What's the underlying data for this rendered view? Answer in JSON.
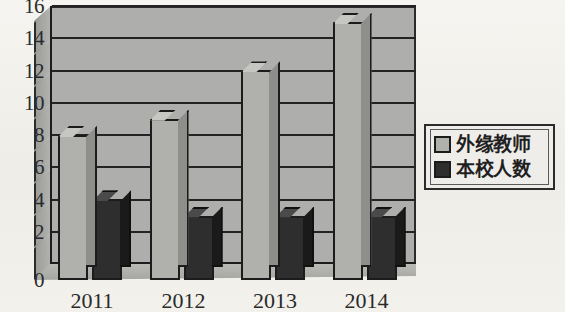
{
  "chart_data": {
    "type": "bar",
    "title": "",
    "subtitle": "",
    "xlabel": "",
    "ylabel": "",
    "categories": [
      "2011",
      "2012",
      "2013",
      "2014"
    ],
    "series": [
      {
        "name": "外缘教师",
        "values": [
          9,
          10,
          13,
          16
        ],
        "color": "#b0b0ad"
      },
      {
        "name": "本校人数",
        "values": [
          5,
          4,
          4,
          4
        ],
        "color": "#2e2e2e"
      }
    ],
    "ylim": [
      0,
      16
    ],
    "ytick_step": 2,
    "yticks": [
      "0",
      "2",
      "4",
      "6",
      "8",
      "10",
      "12",
      "14",
      "16"
    ],
    "grid": true,
    "legend_position": "right",
    "style": "3d-bar",
    "annotations": []
  },
  "legend": {
    "items": [
      {
        "label": "外缘教师",
        "swatch": "light-gray-swatch"
      },
      {
        "label": "本校人数",
        "swatch": "dark-gray-swatch"
      }
    ]
  },
  "axes": {
    "x_tick_labels": [
      "2011",
      "2012",
      "2013",
      "2014"
    ],
    "y_tick_labels": [
      "16",
      "14",
      "12",
      "10",
      "8",
      "6",
      "4",
      "2",
      "0"
    ]
  },
  "colors": {
    "series_light": "#b0b0ad",
    "series_dark": "#2e2e2e",
    "plot_background": "#aeaeac",
    "page_background": "#f3f2ee",
    "axis": "#1d1d1d"
  }
}
